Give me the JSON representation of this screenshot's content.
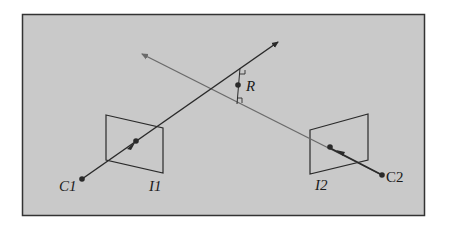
{
  "figure": {
    "background": "#c9c9c9",
    "frame_color": "#333333",
    "ray1_color": "#2a2a2a",
    "ray2_color": "#6a6a6a",
    "labels": {
      "c1": "C1",
      "c2": "C2",
      "i1": "I1",
      "i2": "I2",
      "r": "R"
    }
  }
}
